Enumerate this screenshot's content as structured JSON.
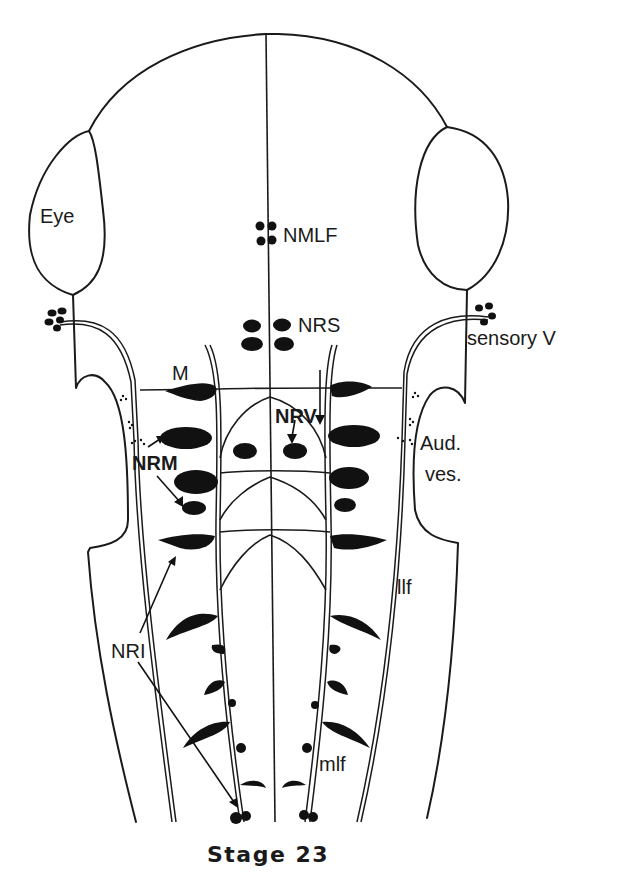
{
  "figure": {
    "title": "Stage 23",
    "labels": {
      "eye": "Eye",
      "nmlf": "NMLF",
      "nrs": "NRS",
      "sensory_v": "sensory V",
      "m": "M",
      "nrv": "NRV",
      "nrm": "NRM",
      "aud_ves_line1": "Aud.",
      "aud_ves_line2": "ves.",
      "llf": "llf",
      "nri": "NRI",
      "mlf": "mlf"
    },
    "colors": {
      "ink": "#111111",
      "background": "#ffffff"
    }
  }
}
